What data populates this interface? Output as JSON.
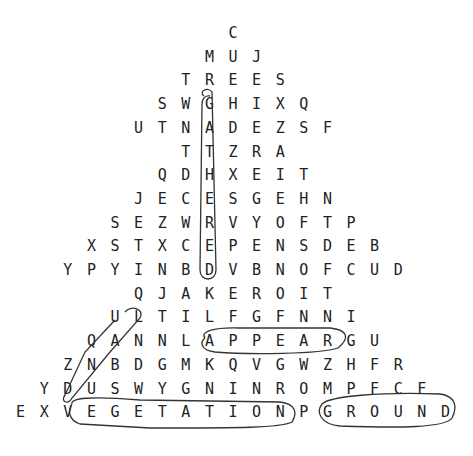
{
  "puzzle": {
    "type": "word-search",
    "shape": "triangle",
    "rows": [
      "C",
      "MUJ",
      "TREES",
      "SWGHIXQ",
      "UTNADEZSF",
      "TTZRA",
      "QDHXEIT",
      "JECESGEHN",
      "SEZWRVYOFTP",
      "XSTXCEPENSDEB",
      "YPYINBDVBNOFCUD",
      "QJAKEROIT",
      "ULTILFGFNNI",
      "QANNLAPPEARGU",
      "ZNBDGMKQVGWZHFR",
      "YDUSWYGNINROMPFCF",
      "EXVEGETATIONPGROUND"
    ],
    "row_offsets": [
      0,
      -1,
      -2,
      -3,
      -4,
      -2,
      -3,
      -4,
      -5,
      -6,
      -7,
      -4,
      -5,
      -6,
      -7,
      -8,
      -9
    ],
    "found_words": [
      "GATHERED",
      "LAND",
      "APPEAR",
      "VEGETATION",
      "GROUND"
    ]
  }
}
